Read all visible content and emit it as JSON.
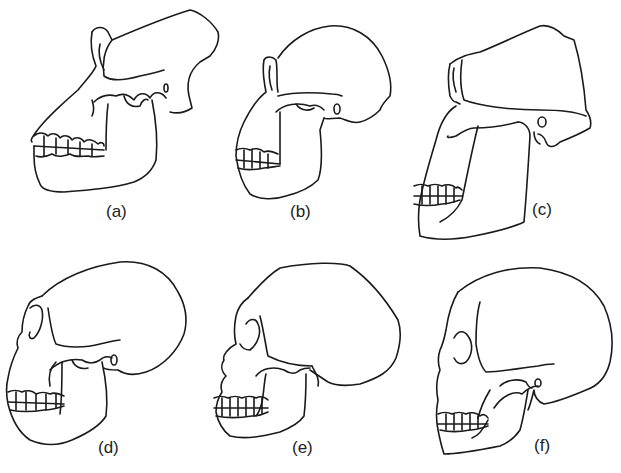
{
  "figure": {
    "stroke_color": "#1a1a1a",
    "background": "#ffffff",
    "panels": [
      {
        "id": "a",
        "label": "(a)"
      },
      {
        "id": "b",
        "label": "(b)"
      },
      {
        "id": "c",
        "label": "(c)"
      },
      {
        "id": "d",
        "label": "(d)"
      },
      {
        "id": "e",
        "label": "(e)"
      },
      {
        "id": "f",
        "label": "(f)"
      }
    ]
  }
}
